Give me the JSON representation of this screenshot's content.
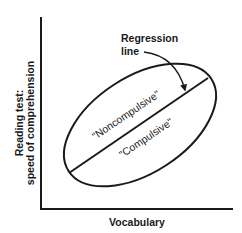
{
  "diagram": {
    "type": "conceptual scatter/regression diagram",
    "x_axis": {
      "label": "Vocabulary"
    },
    "y_axis": {
      "label_line1": "Reading test:",
      "label_line2": "speed of comprehension"
    },
    "annotation": {
      "line1": "Regression",
      "line2": "line"
    },
    "regions": {
      "upper": "\"Noncompulsive\"",
      "lower": "\"Compulsive\""
    },
    "colors": {
      "ink": "#1a1a1a",
      "background": "#ffffff"
    }
  }
}
